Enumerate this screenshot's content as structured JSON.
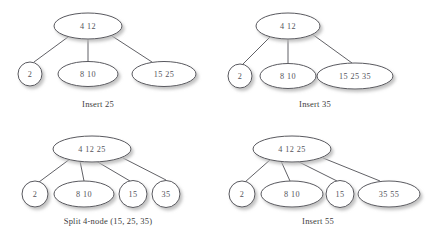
{
  "figure": {
    "background_color": "#ffffff",
    "stroke_color": "#4f4f55",
    "text_color": "#55555c",
    "shadow_color": "#c9c9c9"
  },
  "panels": [
    {
      "id": "panel-insert-25",
      "caption": "Insert 25",
      "caption_x": 98,
      "caption_y": 99,
      "nodes": [
        {
          "id": "root",
          "label": "4   12",
          "keys": [
            "4",
            "12"
          ],
          "cx": 88,
          "cy": 26,
          "rx": 34,
          "ry": 13
        },
        {
          "id": "child-2",
          "label": "2",
          "keys": [
            "2"
          ],
          "cx": 30,
          "cy": 74,
          "rx": 12,
          "ry": 12
        },
        {
          "id": "child-8-10",
          "label": "8  10",
          "keys": [
            "8",
            "10"
          ],
          "cx": 88,
          "cy": 74,
          "rx": 30,
          "ry": 12.5
        },
        {
          "id": "child-15-25",
          "label": "15  25",
          "keys": [
            "15",
            "25"
          ],
          "cx": 164,
          "cy": 74,
          "rx": 32,
          "ry": 12.5
        }
      ],
      "edges": [
        {
          "from": "root",
          "to": "child-2",
          "x1": 68,
          "y1": 37,
          "x2": 34,
          "y2": 62
        },
        {
          "from": "root",
          "to": "child-8-10",
          "x1": 88,
          "y1": 39,
          "x2": 88,
          "y2": 62
        },
        {
          "from": "root",
          "to": "child-15-25",
          "x1": 112,
          "y1": 36,
          "x2": 152,
          "y2": 62
        }
      ]
    },
    {
      "id": "panel-insert-35",
      "caption": "Insert 35",
      "caption_x": 315,
      "caption_y": 99,
      "nodes": [
        {
          "id": "root",
          "label": "4   12",
          "keys": [
            "4",
            "12"
          ],
          "cx": 288,
          "cy": 26,
          "rx": 32,
          "ry": 13
        },
        {
          "id": "child-2",
          "label": "2",
          "keys": [
            "2"
          ],
          "cx": 240,
          "cy": 76,
          "rx": 12,
          "ry": 12
        },
        {
          "id": "child-8-10",
          "label": "8  10",
          "keys": [
            "8",
            "10"
          ],
          "cx": 288,
          "cy": 76,
          "rx": 28,
          "ry": 12.5
        },
        {
          "id": "child-15-25-35",
          "label": "15  25  35",
          "keys": [
            "15",
            "25",
            "35"
          ],
          "cx": 355,
          "cy": 76,
          "rx": 38,
          "ry": 13
        }
      ],
      "edges": [
        {
          "from": "root",
          "to": "child-2",
          "x1": 270,
          "y1": 37,
          "x2": 243,
          "y2": 64
        },
        {
          "from": "root",
          "to": "child-8-10",
          "x1": 288,
          "y1": 39,
          "x2": 288,
          "y2": 63
        },
        {
          "from": "root",
          "to": "child-15-25-35",
          "x1": 312,
          "y1": 34,
          "x2": 352,
          "y2": 63
        }
      ]
    },
    {
      "id": "panel-split-4-node",
      "caption": "Split 4-node (15, 25, 35)",
      "caption_x": 108,
      "caption_y": 216,
      "nodes": [
        {
          "id": "root",
          "label": "4    12    25",
          "keys": [
            "4",
            "12",
            "25"
          ],
          "cx": 92,
          "cy": 149,
          "rx": 39,
          "ry": 13
        },
        {
          "id": "child-2",
          "label": "2",
          "keys": [
            "2"
          ],
          "cx": 35,
          "cy": 194,
          "rx": 13,
          "ry": 13
        },
        {
          "id": "child-8-10",
          "label": "8  10",
          "keys": [
            "8",
            "10"
          ],
          "cx": 84,
          "cy": 194,
          "rx": 30,
          "ry": 13
        },
        {
          "id": "child-15",
          "label": "15",
          "keys": [
            "15"
          ],
          "cx": 133,
          "cy": 194,
          "rx": 14,
          "ry": 13.5
        },
        {
          "id": "child-35",
          "label": "35",
          "keys": [
            "35"
          ],
          "cx": 166,
          "cy": 194,
          "rx": 14,
          "ry": 13.5
        }
      ],
      "edges": [
        {
          "from": "root",
          "to": "child-2",
          "x1": 70,
          "y1": 159,
          "x2": 39,
          "y2": 182
        },
        {
          "from": "root",
          "to": "child-8-10",
          "x1": 80,
          "y1": 161,
          "x2": 84,
          "y2": 181
        },
        {
          "from": "root",
          "to": "child-15",
          "x1": 96,
          "y1": 161,
          "x2": 130,
          "y2": 181
        },
        {
          "from": "root",
          "to": "child-35",
          "x1": 123,
          "y1": 158,
          "x2": 166,
          "y2": 180
        }
      ]
    },
    {
      "id": "panel-insert-55",
      "caption": "Insert 55",
      "caption_x": 318,
      "caption_y": 216,
      "nodes": [
        {
          "id": "root",
          "label": "4    12    25",
          "keys": [
            "4",
            "12",
            "25"
          ],
          "cx": 292,
          "cy": 149,
          "rx": 39,
          "ry": 13
        },
        {
          "id": "child-2",
          "label": "2",
          "keys": [
            "2"
          ],
          "cx": 242,
          "cy": 194,
          "rx": 13,
          "ry": 13
        },
        {
          "id": "child-8-10",
          "label": "8  10",
          "keys": [
            "8",
            "10"
          ],
          "cx": 292,
          "cy": 194,
          "rx": 31,
          "ry": 13
        },
        {
          "id": "child-15",
          "label": "15",
          "keys": [
            "15"
          ],
          "cx": 340,
          "cy": 194,
          "rx": 14,
          "ry": 13.5
        },
        {
          "id": "child-35-55",
          "label": "35  55",
          "keys": [
            "35",
            "55"
          ],
          "cx": 389,
          "cy": 194,
          "rx": 31,
          "ry": 13
        }
      ],
      "edges": [
        {
          "from": "root",
          "to": "child-2",
          "x1": 271,
          "y1": 159,
          "x2": 245,
          "y2": 182
        },
        {
          "from": "root",
          "to": "child-8-10",
          "x1": 281,
          "y1": 161,
          "x2": 290,
          "y2": 181
        },
        {
          "from": "root",
          "to": "child-15",
          "x1": 297,
          "y1": 161,
          "x2": 337,
          "y2": 181
        },
        {
          "from": "root",
          "to": "child-35-55",
          "x1": 323,
          "y1": 158,
          "x2": 380,
          "y2": 181
        }
      ]
    }
  ]
}
